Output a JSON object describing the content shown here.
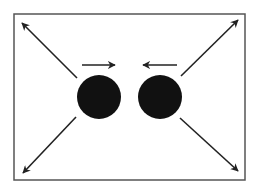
{
  "diagram": {
    "frame": {
      "x": 14,
      "y": 14,
      "width": 231,
      "height": 166,
      "stroke": "#555555"
    },
    "circles": [
      {
        "name": "left-ball",
        "cx": 99,
        "cy": 97,
        "r": 22,
        "fill": "#111111"
      },
      {
        "name": "right-ball",
        "cx": 160,
        "cy": 97,
        "r": 22,
        "fill": "#111111"
      }
    ],
    "arrows": [
      {
        "name": "arrow-up-left",
        "x1": 77,
        "y1": 78,
        "x2": 22,
        "y2": 23
      },
      {
        "name": "arrow-up-right",
        "x1": 181,
        "y1": 76,
        "x2": 238,
        "y2": 20
      },
      {
        "name": "arrow-down-left",
        "x1": 76,
        "y1": 117,
        "x2": 23,
        "y2": 173
      },
      {
        "name": "arrow-down-right",
        "x1": 180,
        "y1": 118,
        "x2": 238,
        "y2": 171
      },
      {
        "name": "arrow-right-toward-center",
        "x1": 82,
        "y1": 65,
        "x2": 115,
        "y2": 65
      },
      {
        "name": "arrow-left-toward-center",
        "x1": 177,
        "y1": 65,
        "x2": 143,
        "y2": 65
      }
    ],
    "arrow_color": "#222222"
  }
}
